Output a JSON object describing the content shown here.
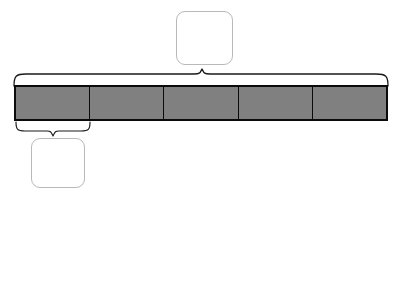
{
  "worksheet": {
    "title": "Tape diagram fraction/multiplication worksheet",
    "background_color": "#ffffff"
  },
  "tape_diagram": {
    "total_segments": 5,
    "shaded_segments": 5,
    "segment_fill_color": "#808080",
    "outline_color": "#0b0b0b",
    "segments": [
      {
        "index": 1,
        "value": "",
        "shaded": true
      },
      {
        "index": 2,
        "value": "",
        "shaded": true
      },
      {
        "index": 3,
        "value": "",
        "shaded": true
      },
      {
        "index": 4,
        "value": "",
        "shaded": true
      },
      {
        "index": 5,
        "value": "",
        "shaded": true
      }
    ]
  },
  "braces": {
    "whole_brace": {
      "label": "brace spanning entire tape",
      "spans_segments": 5,
      "points_to": "top-answer-box"
    },
    "unit_brace": {
      "label": "brace spanning one unit segment",
      "spans_segments": 1,
      "points_to": "bottom-answer-box"
    }
  },
  "answer_boxes": {
    "whole_amount": {
      "value": "",
      "placeholder": ""
    },
    "unit_amount": {
      "value": "",
      "placeholder": ""
    }
  },
  "equation": {
    "blank_1": {
      "value": "",
      "placeholder": ""
    },
    "operator": {
      "value": "",
      "placeholder": "",
      "shape": "circle"
    },
    "blank_2": {
      "value": "",
      "placeholder": ""
    },
    "equals_symbol": "=",
    "blank_3": {
      "value": "",
      "placeholder": ""
    }
  },
  "colors": {
    "segment_gray": "#808080",
    "bar_outline": "#0b0b0b",
    "box_border": "#b9b9b9",
    "line_gray": "#b0b0b0",
    "equals_gray": "#555555"
  }
}
